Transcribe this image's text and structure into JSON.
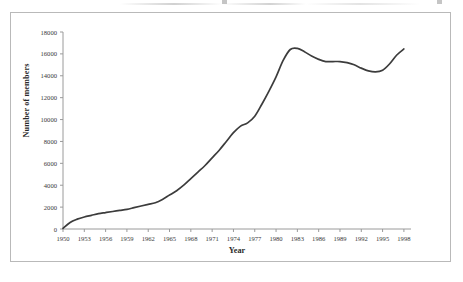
{
  "figure": {
    "frame_color": "#b9b9b9",
    "background": "#ffffff",
    "line_color": "#3c3c3c"
  },
  "axis_titles": {
    "x": "Year",
    "y": "Number of members"
  },
  "chart_data": {
    "type": "line",
    "title": "",
    "subtitle": "",
    "xlabel": "Year",
    "ylabel": "Number of members",
    "xlim": [
      1950,
      1999
    ],
    "ylim": [
      0,
      18000
    ],
    "grid": false,
    "legend": false,
    "legend_position": "none",
    "x_tick_labels": [
      "1950",
      "1953",
      "1956",
      "1959",
      "1962",
      "1965",
      "1968",
      "1971",
      "1974",
      "1977",
      "1980",
      "1983",
      "1986",
      "1989",
      "1992",
      "1995",
      "1998"
    ],
    "x_ticks": [
      1950,
      1953,
      1956,
      1959,
      1962,
      1965,
      1968,
      1971,
      1974,
      1977,
      1980,
      1983,
      1986,
      1989,
      1992,
      1995,
      1998
    ],
    "y_tick_labels": [
      "0",
      "2000",
      "4000",
      "6000",
      "8000",
      "10000",
      "12000",
      "14000",
      "16000",
      "18000"
    ],
    "y_ticks": [
      0,
      2000,
      4000,
      6000,
      8000,
      10000,
      12000,
      14000,
      16000,
      18000
    ],
    "series": [
      {
        "name": "Number of members",
        "color": "#3c3c3c",
        "x": [
          1950,
          1951,
          1952,
          1953,
          1954,
          1955,
          1956,
          1957,
          1958,
          1959,
          1960,
          1961,
          1962,
          1963,
          1964,
          1965,
          1966,
          1967,
          1968,
          1969,
          1970,
          1971,
          1972,
          1973,
          1974,
          1975,
          1976,
          1977,
          1978,
          1979,
          1980,
          1981,
          1982,
          1983,
          1984,
          1985,
          1986,
          1987,
          1988,
          1989,
          1990,
          1991,
          1992,
          1993,
          1994,
          1995,
          1996,
          1997,
          1998
        ],
        "y": [
          50,
          600,
          900,
          1100,
          1250,
          1400,
          1500,
          1600,
          1700,
          1800,
          1950,
          2100,
          2250,
          2400,
          2700,
          3100,
          3500,
          4000,
          4600,
          5200,
          5800,
          6500,
          7200,
          8000,
          8800,
          9400,
          9700,
          10300,
          11400,
          12600,
          13900,
          15400,
          16400,
          16500,
          16200,
          15800,
          15500,
          15300,
          15300,
          15300,
          15200,
          15000,
          14700,
          14450,
          14350,
          14500,
          15100,
          15900,
          16450
        ]
      }
    ]
  }
}
